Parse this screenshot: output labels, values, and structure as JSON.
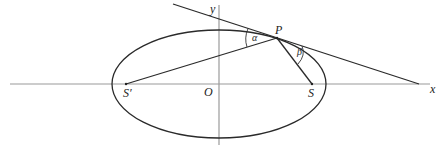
{
  "figure": {
    "type": "ellipse-reflection-property",
    "labels": {
      "x_axis": "x",
      "y_axis": "y",
      "origin": "O",
      "point_on_ellipse": "P",
      "focus_right": "S",
      "focus_left": "S′",
      "angle_left": "α",
      "angle_right": "β"
    },
    "colors": {
      "axis": "#9a9a9a",
      "curve": "#2a2a2a",
      "text": "#222222"
    }
  }
}
